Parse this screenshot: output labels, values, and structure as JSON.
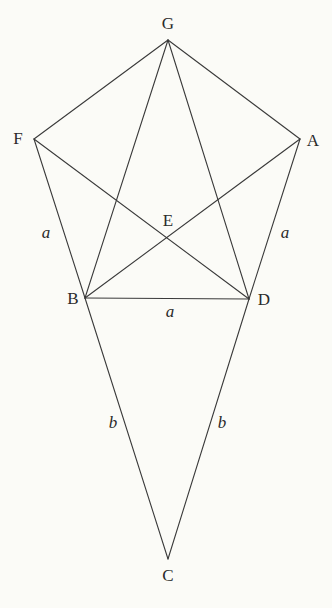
{
  "diagram": {
    "background": "#fbfbf7",
    "line_color": "#3a3a3a",
    "vertices": {
      "G": {
        "label": "G",
        "x": 168,
        "y": 40,
        "lx": 168,
        "ly": 25
      },
      "F": {
        "label": "F",
        "x": 34,
        "y": 139,
        "lx": 18,
        "ly": 140
      },
      "A": {
        "label": "A",
        "x": 300,
        "y": 139,
        "lx": 313,
        "ly": 142
      },
      "E": {
        "label": "E",
        "x": 168,
        "y": 238,
        "lx": 168,
        "ly": 222
      },
      "B": {
        "label": "B",
        "x": 85,
        "y": 298,
        "lx": 73,
        "ly": 300
      },
      "D": {
        "label": "D",
        "x": 249,
        "y": 299,
        "lx": 264,
        "ly": 301
      },
      "C": {
        "label": "C",
        "x": 168,
        "y": 559,
        "lx": 168,
        "ly": 577
      }
    },
    "edges": [
      [
        "G",
        "F"
      ],
      [
        "G",
        "A"
      ],
      [
        "G",
        "B"
      ],
      [
        "G",
        "D"
      ],
      [
        "F",
        "B"
      ],
      [
        "F",
        "D"
      ],
      [
        "A",
        "D"
      ],
      [
        "A",
        "B"
      ],
      [
        "B",
        "D"
      ],
      [
        "B",
        "C"
      ],
      [
        "D",
        "C"
      ]
    ],
    "side_labels": [
      {
        "text": "a",
        "x": 46,
        "y": 234,
        "side": "FB"
      },
      {
        "text": "a",
        "x": 285,
        "y": 234,
        "side": "AD"
      },
      {
        "text": "a",
        "x": 170,
        "y": 313,
        "side": "BD"
      },
      {
        "text": "b",
        "x": 113,
        "y": 424,
        "side": "BC"
      },
      {
        "text": "b",
        "x": 222,
        "y": 424,
        "side": "DC"
      }
    ]
  }
}
